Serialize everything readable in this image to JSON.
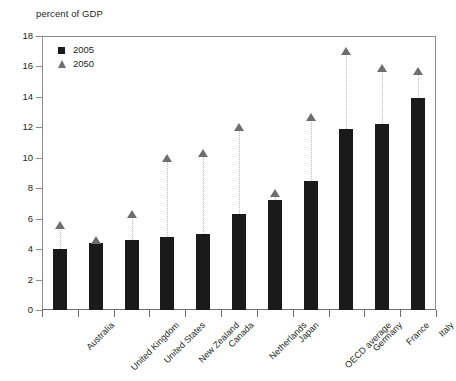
{
  "chart_data": {
    "type": "bar",
    "title": "",
    "ylabel": "percent of GDP",
    "xlabel": "",
    "ylim": [
      0,
      18
    ],
    "ytick_step": 2,
    "yticks": [
      "0",
      "2",
      "4",
      "6",
      "8",
      "10",
      "12",
      "14",
      "16",
      "18"
    ],
    "grid": false,
    "legend_position": "top-left",
    "categories": [
      "Australia",
      "United Kingdom",
      "United States",
      "New Zealand",
      "Canada",
      "Netherlands",
      "Japan",
      "OECD average",
      "Germany",
      "France",
      "Italy"
    ],
    "series": [
      {
        "name": "2005",
        "marker": "square",
        "color": "#1a1a1a",
        "values": [
          4.0,
          4.4,
          4.6,
          4.8,
          5.0,
          6.3,
          7.2,
          8.5,
          11.9,
          12.2,
          13.9
        ]
      },
      {
        "name": "2050",
        "marker": "triangle",
        "color": "#6e6e6e",
        "values": [
          5.6,
          4.6,
          6.3,
          10.0,
          10.3,
          12.0,
          7.7,
          12.7,
          17.0,
          15.9,
          15.7
        ]
      }
    ]
  },
  "legend": {
    "items": [
      {
        "label": "2005"
      },
      {
        "label": "2050"
      }
    ]
  },
  "colors": {
    "bar": "#1a1a1a",
    "marker": "#6e6e6e",
    "axis": "#8c8c8c",
    "text": "#231f20"
  }
}
